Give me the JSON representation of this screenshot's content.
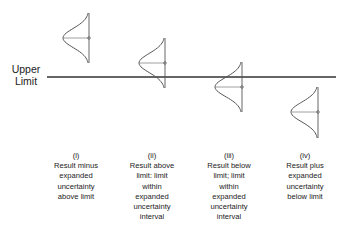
{
  "limit_label": {
    "line1": "Upper",
    "line2": "Limit"
  },
  "colors": {
    "line": "#333333",
    "curve": "#555555",
    "text": "#222222",
    "background": "#ffffff"
  },
  "limit_line": {
    "x1": 47,
    "x2": 336,
    "y": 77
  },
  "cases": [
    {
      "id": "i",
      "numeral": "(i)",
      "lines": [
        "Result minus",
        "expanded",
        "uncertainty",
        "above limit"
      ],
      "curve": {
        "left_x": 63,
        "axis_x": 89,
        "top_y": 13,
        "mid_y": 38,
        "bottom_y": 63
      },
      "caption_center_x": 76
    },
    {
      "id": "ii",
      "numeral": "(ii)",
      "lines": [
        "Result above",
        "limit: limit",
        "within",
        "expanded",
        "uncertainty",
        "interval"
      ],
      "curve": {
        "left_x": 139,
        "axis_x": 165,
        "top_y": 38,
        "mid_y": 63,
        "bottom_y": 88
      },
      "caption_center_x": 152
    },
    {
      "id": "iii",
      "numeral": "(iii)",
      "lines": [
        "Result below",
        "limit; limit",
        "within",
        "expanded",
        "uncertainty",
        "interval"
      ],
      "curve": {
        "left_x": 215,
        "axis_x": 242,
        "top_y": 62,
        "mid_y": 87,
        "bottom_y": 112
      },
      "caption_center_x": 229
    },
    {
      "id": "iv",
      "numeral": "(iv)",
      "lines": [
        "Result plus",
        "expanded",
        "uncertainty",
        "below limit"
      ],
      "curve": {
        "left_x": 291,
        "axis_x": 318,
        "top_y": 87,
        "mid_y": 112,
        "bottom_y": 138
      },
      "caption_center_x": 305
    }
  ]
}
